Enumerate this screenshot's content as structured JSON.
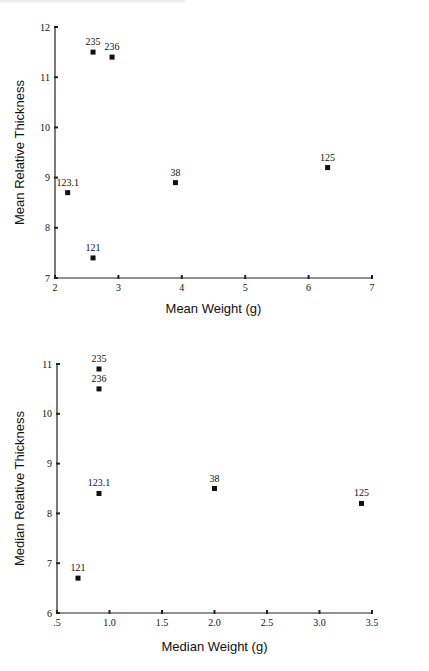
{
  "chart_data": [
    {
      "type": "scatter",
      "title": "",
      "xlabel": "Mean Weight (g)",
      "ylabel": "Mean Relative Thickness",
      "xlim": [
        2,
        7
      ],
      "ylim": [
        7,
        12
      ],
      "xticks": [
        "2",
        "3",
        "4",
        "5",
        "6",
        "7"
      ],
      "yticks": [
        "7",
        "8",
        "9",
        "10",
        "11",
        "12"
      ],
      "grid": false,
      "legend": null,
      "points": [
        {
          "label": "235",
          "x": 2.6,
          "y": 11.5
        },
        {
          "label": "236",
          "x": 2.9,
          "y": 11.4
        },
        {
          "label": "123.1",
          "x": 2.2,
          "y": 8.7
        },
        {
          "label": "38",
          "x": 3.9,
          "y": 8.9
        },
        {
          "label": "125",
          "x": 6.3,
          "y": 9.2
        },
        {
          "label": "121",
          "x": 2.6,
          "y": 7.4
        }
      ]
    },
    {
      "type": "scatter",
      "title": "",
      "xlabel": "Median Weight (g)",
      "ylabel": "Median Relative Thickness",
      "xlim": [
        0.5,
        3.5
      ],
      "ylim": [
        6,
        11
      ],
      "xticks": [
        ".5",
        "1.0",
        "1.5",
        "2.0",
        "2.5",
        "3.0",
        "3.5"
      ],
      "yticks": [
        "6",
        "7",
        "8",
        "9",
        "10",
        "11"
      ],
      "grid": false,
      "legend": null,
      "points": [
        {
          "label": "235",
          "x": 0.9,
          "y": 10.9
        },
        {
          "label": "236",
          "x": 0.9,
          "y": 10.5
        },
        {
          "label": "123.1",
          "x": 0.9,
          "y": 8.4
        },
        {
          "label": "38",
          "x": 2.0,
          "y": 8.5
        },
        {
          "label": "125",
          "x": 3.4,
          "y": 8.2
        },
        {
          "label": "121",
          "x": 0.7,
          "y": 6.7
        }
      ]
    }
  ]
}
